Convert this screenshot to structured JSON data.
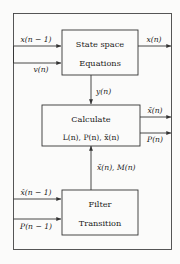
{
  "diagram": {
    "type": "block-diagram",
    "blocks": [
      {
        "id": "state-space",
        "line1": "State space",
        "line2": "Equations"
      },
      {
        "id": "calculate",
        "line1": "Calculate",
        "line2": "L(n),  P(n),  x̃(n)"
      },
      {
        "id": "filter-transition",
        "line1": "Filter",
        "line2": "Transition"
      }
    ],
    "signals": {
      "input_x_prev": "x(n − 1)",
      "input_v": "v(n)",
      "output_x": "x(n)",
      "y_signal": "y(n)",
      "output_x_tilde": "x̃(n)",
      "output_p": "P(n)",
      "feedback_up": "x̃(n),  M(n)",
      "input_x_hat_prev": "x̂(n − 1)",
      "input_p_prev": "P(n − 1)"
    },
    "colors": {
      "background": "#fbfbfa",
      "stroke": "#333333",
      "frame": "#444444",
      "text": "#1b1b1b"
    }
  }
}
